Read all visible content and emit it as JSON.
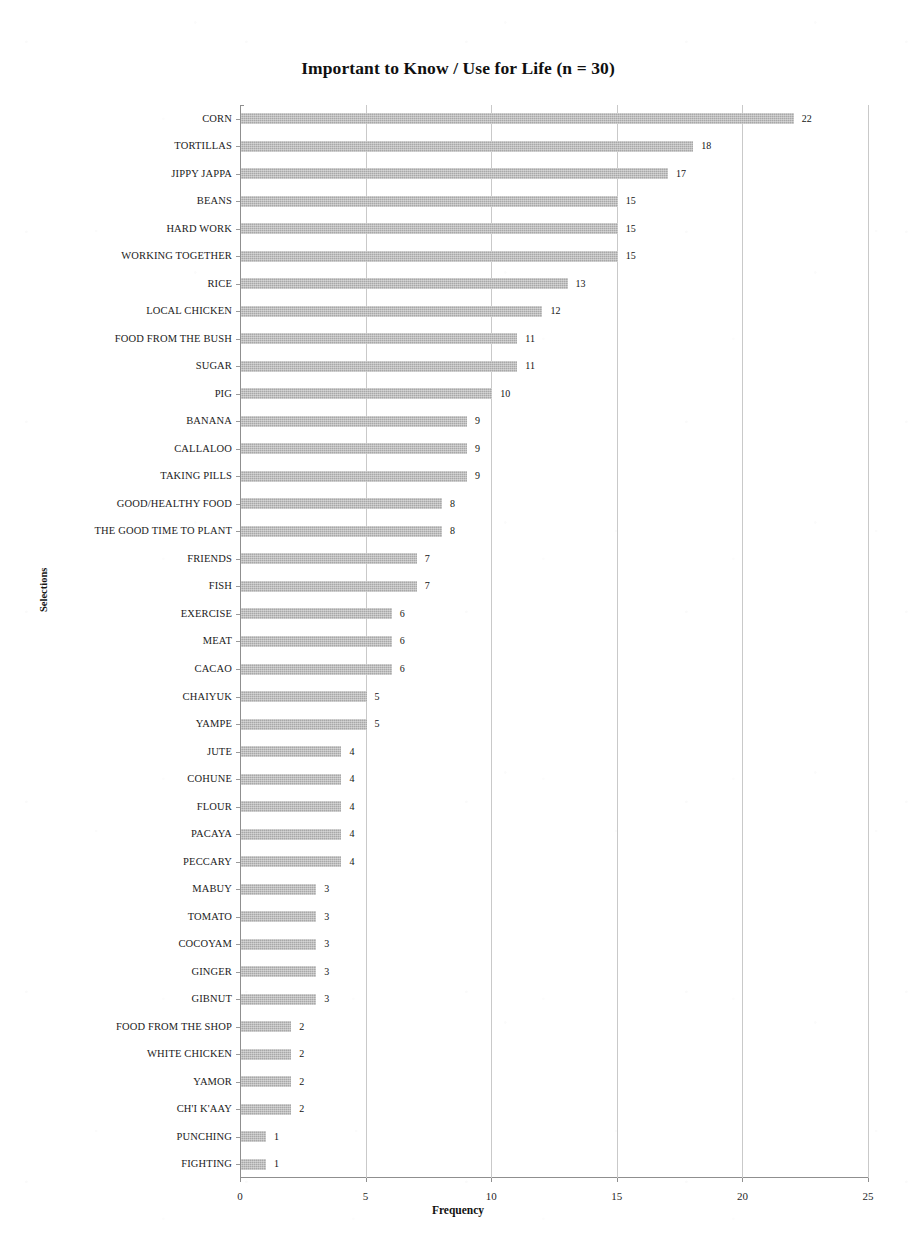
{
  "chart_data": {
    "type": "bar",
    "orientation": "horizontal",
    "title": "Important to Know / Use for Life  (n = 30)",
    "xlabel": "Frequency",
    "ylabel": "Selections",
    "xlim": [
      0,
      25
    ],
    "xticks": [
      0,
      5,
      10,
      15,
      20,
      25
    ],
    "xtick_labels": [
      "0",
      "5",
      "10",
      "15",
      "20",
      "25"
    ],
    "grid": "vertical",
    "legend": "none",
    "bar_color": "#a8a8a8",
    "show_value_labels": true,
    "sample_size": 30,
    "categories": [
      "CORN",
      "TORTILLAS",
      "JIPPY JAPPA",
      "BEANS",
      "HARD WORK",
      "WORKING TOGETHER",
      "RICE",
      "LOCAL CHICKEN",
      "FOOD FROM THE BUSH",
      "SUGAR",
      "PIG",
      "BANANA",
      "CALLALOO",
      "TAKING PILLS",
      "GOOD/HEALTHY FOOD",
      "THE GOOD TIME TO PLANT",
      "FRIENDS",
      "FISH",
      "EXERCISE",
      "MEAT",
      "CACAO",
      "CHAIYUK",
      "YAMPE",
      "JUTE",
      "COHUNE",
      "FLOUR",
      "PACAYA",
      "PECCARY",
      "MABUY",
      "TOMATO",
      "COCOYAM",
      "GINGER",
      "GIBNUT",
      "FOOD FROM THE SHOP",
      "WHITE CHICKEN",
      "YAMOR",
      "CH'I K'AAY",
      "PUNCHING",
      "FIGHTING"
    ],
    "values": [
      22,
      18,
      17,
      15,
      15,
      15,
      13,
      12,
      11,
      11,
      10,
      9,
      9,
      9,
      8,
      8,
      7,
      7,
      6,
      6,
      6,
      5,
      5,
      4,
      4,
      4,
      4,
      4,
      3,
      3,
      3,
      3,
      3,
      2,
      2,
      2,
      2,
      1,
      1
    ],
    "value_labels": [
      "22",
      "18",
      "17",
      "15",
      "15",
      "15",
      "13",
      "12",
      "11",
      "11",
      "10",
      "9",
      "9",
      "9",
      "8",
      "8",
      "7",
      "7",
      "6",
      "6",
      "6",
      "5",
      "5",
      "4",
      "4",
      "4",
      "4",
      "4",
      "3",
      "3",
      "3",
      "3",
      "3",
      "2",
      "2",
      "2",
      "2",
      "1",
      "1"
    ]
  }
}
